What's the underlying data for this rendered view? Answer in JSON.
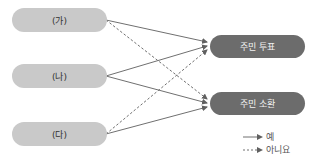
{
  "sources": [
    {
      "id": "ga",
      "label": "(가)"
    },
    {
      "id": "na",
      "label": "(나)"
    },
    {
      "id": "da",
      "label": "(다)"
    }
  ],
  "targets": [
    {
      "id": "vote",
      "label": "주민 투표"
    },
    {
      "id": "recall",
      "label": "주민 소환"
    }
  ],
  "edges": [
    {
      "from": "ga",
      "to": "vote",
      "type": "yes"
    },
    {
      "from": "ga",
      "to": "recall",
      "type": "no"
    },
    {
      "from": "na",
      "to": "vote",
      "type": "yes"
    },
    {
      "from": "na",
      "to": "recall",
      "type": "yes"
    },
    {
      "from": "da",
      "to": "vote",
      "type": "no"
    },
    {
      "from": "da",
      "to": "recall",
      "type": "yes"
    }
  ],
  "legend": {
    "yes": "예",
    "no": "아니요"
  },
  "colors": {
    "source_fill": "#c9c9c9",
    "target_fill": "#6c6c6c",
    "line": "#707070"
  }
}
